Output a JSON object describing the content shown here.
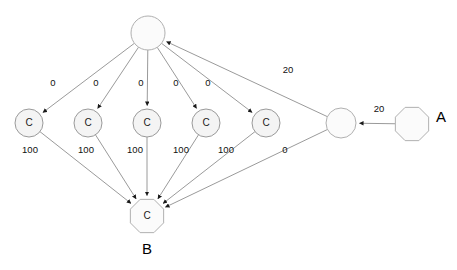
{
  "diagram": {
    "type": "directed-graph",
    "canvas": {
      "width": 457,
      "height": 270,
      "background": "#ffffff"
    },
    "colors": {
      "node_fill": "#f4f4f4",
      "node_stroke": "#9a9a9a",
      "edge_stroke": "#8f8f8f",
      "text": "#111111"
    },
    "nodes": [
      {
        "id": "root",
        "label": "",
        "shape": "circle",
        "cx": 148,
        "cy": 33,
        "r": 17
      },
      {
        "id": "c1",
        "label": "C",
        "shape": "circle",
        "cx": 29,
        "cy": 123,
        "r": 14
      },
      {
        "id": "c2",
        "label": "C",
        "shape": "circle",
        "cx": 88,
        "cy": 123,
        "r": 14
      },
      {
        "id": "c3",
        "label": "C",
        "shape": "circle",
        "cx": 147,
        "cy": 123,
        "r": 14
      },
      {
        "id": "c4",
        "label": "C",
        "shape": "circle",
        "cx": 206,
        "cy": 123,
        "r": 14
      },
      {
        "id": "c5",
        "label": "C",
        "shape": "circle",
        "cx": 266,
        "cy": 123,
        "r": 14
      },
      {
        "id": "r1",
        "label": "",
        "shape": "circle",
        "cx": 341,
        "cy": 123,
        "r": 15
      },
      {
        "id": "a",
        "label": "",
        "shape": "octagon",
        "cx": 412,
        "cy": 124,
        "r": 18,
        "outer_label": "A"
      },
      {
        "id": "b",
        "label": "C",
        "shape": "octagon",
        "cx": 147,
        "cy": 216,
        "r": 18,
        "outer_label": "B"
      }
    ],
    "outer_labels": [
      {
        "id": "label-a",
        "text": "A",
        "x": 441,
        "y": 118
      },
      {
        "id": "label-b",
        "text": "B",
        "x": 147,
        "y": 250
      }
    ],
    "edges": [
      {
        "id": "e-root-c1",
        "from": "root",
        "to": "c1",
        "label": "0",
        "label_x": 53,
        "label_y": 83
      },
      {
        "id": "e-root-c2",
        "from": "root",
        "to": "c2",
        "label": "0",
        "label_x": 96,
        "label_y": 83
      },
      {
        "id": "e-root-c3",
        "from": "root",
        "to": "c3",
        "label": "0",
        "label_x": 141,
        "label_y": 83
      },
      {
        "id": "e-root-c4",
        "from": "root",
        "to": "c4",
        "label": "0",
        "label_x": 176,
        "label_y": 83
      },
      {
        "id": "e-root-c5",
        "from": "root",
        "to": "c5",
        "label": "0",
        "label_x": 208,
        "label_y": 83
      },
      {
        "id": "e-r1-root",
        "from": "r1",
        "to": "root",
        "label": "20",
        "label_x": 288,
        "label_y": 70
      },
      {
        "id": "e-a-r1",
        "from": "a",
        "to": "r1",
        "label": "20",
        "label_x": 379,
        "label_y": 109
      },
      {
        "id": "e-c1-b",
        "from": "c1",
        "to": "b",
        "label": "100",
        "label_x": 30,
        "label_y": 150
      },
      {
        "id": "e-c2-b",
        "from": "c2",
        "to": "b",
        "label": "100",
        "label_x": 86,
        "label_y": 150
      },
      {
        "id": "e-c3-b",
        "from": "c3",
        "to": "b",
        "label": "100",
        "label_x": 135,
        "label_y": 150
      },
      {
        "id": "e-c4-b",
        "from": "c4",
        "to": "b",
        "label": "100",
        "label_x": 181,
        "label_y": 150
      },
      {
        "id": "e-c5-b",
        "from": "c5",
        "to": "b",
        "label": "100",
        "label_x": 226,
        "label_y": 150
      },
      {
        "id": "e-r1-b",
        "from": "r1",
        "to": "b",
        "label": "0",
        "label_x": 285,
        "label_y": 150
      }
    ]
  }
}
